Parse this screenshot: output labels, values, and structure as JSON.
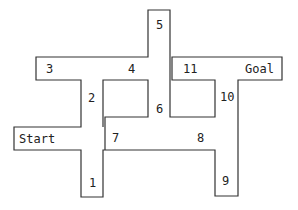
{
  "diagram": {
    "type": "maze-path",
    "stroke_color": "#333333",
    "background": "#ffffff",
    "labels": {
      "start": "Start",
      "goal": "Goal",
      "n1": "1",
      "n2": "2",
      "n3": "3",
      "n4": "4",
      "n5": "5",
      "n6": "6",
      "n7": "7",
      "n8": "8",
      "n9": "9",
      "n10": "10",
      "n11": "11"
    }
  }
}
